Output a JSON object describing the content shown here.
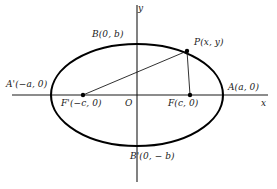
{
  "figure": {
    "type": "conic-section-diagram",
    "shape": "ellipse",
    "background_color": "#ffffff",
    "stroke_color": "#000000",
    "width": 277,
    "height": 189
  },
  "axes": {
    "x_label": "x",
    "y_label": "y",
    "origin_label": "O",
    "x_axis": {
      "y": 95,
      "x_start": 12,
      "x_end": 268
    },
    "y_axis": {
      "x": 137,
      "y_start": 5,
      "y_end": 182
    }
  },
  "ellipse": {
    "center": {
      "x": 137,
      "y": 95
    },
    "semi_major_px": 86,
    "semi_minor_px": 51
  },
  "points": {
    "vertex_right": {
      "label": "A(a, 0)",
      "x": 223,
      "y": 95
    },
    "vertex_left": {
      "label": "A'(−a, 0)",
      "x": 51,
      "y": 95
    },
    "covertex_top": {
      "label": "B(0, b)",
      "x": 137,
      "y": 44
    },
    "covertex_bottom": {
      "label": "B'(0, − b)",
      "x": 137,
      "y": 146
    },
    "point_p": {
      "label": "P(x, y)",
      "x": 187,
      "y": 51
    },
    "focus_right": {
      "label": "F(c, 0)",
      "x": 190,
      "y": 95
    },
    "focus_left": {
      "label": "F'(−c, 0)",
      "x": 83,
      "y": 95
    },
    "origin": {
      "label": "O",
      "x": 137,
      "y": 95
    }
  },
  "segments": [
    {
      "name": "focal-radius-left",
      "from": "focus_left",
      "to": "point_p"
    },
    {
      "name": "focal-radius-right",
      "from": "focus_right",
      "to": "point_p"
    }
  ]
}
